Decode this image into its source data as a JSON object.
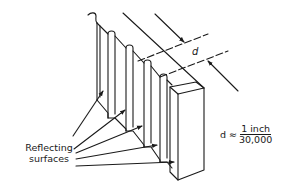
{
  "diagram": {
    "labels": {
      "reflecting_surfaces": [
        "Reflecting",
        "surfaces"
      ],
      "dimension": "d",
      "formula_lhs": "d ≈",
      "formula_numerator": "1 inch",
      "formula_denominator": "30,000"
    },
    "colors": {
      "stroke": "#1a1a1a",
      "background": "#ffffff"
    },
    "components": [
      "grating-fins",
      "end-block",
      "dimension-lines",
      "pointer-arrows"
    ]
  }
}
